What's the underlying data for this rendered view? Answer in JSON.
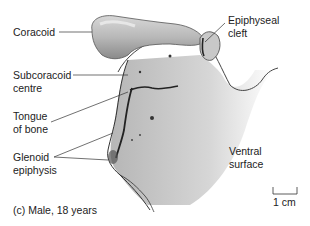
{
  "labels": {
    "coracoid": "Coracoid",
    "epiphyseal_cleft_1": "Epiphyseal",
    "epiphyseal_cleft_2": "cleft",
    "subcoracoid_1": "Subcoracoid",
    "subcoracoid_2": "centre",
    "tongue_1": "Tongue",
    "tongue_2": "of bone",
    "glenoid_1": "Glenoid",
    "glenoid_2": "epiphysis",
    "ventral_1": "Ventral",
    "ventral_2": "surface"
  },
  "scale_bar": {
    "label": "1 cm"
  },
  "caption": "(c) Male, 18 years",
  "colors": {
    "bone_light": "#e2e2e2",
    "bone_mid": "#b5b5b5",
    "bone_dark": "#6e6e6e",
    "outline": "#333333",
    "text": "#222222"
  }
}
